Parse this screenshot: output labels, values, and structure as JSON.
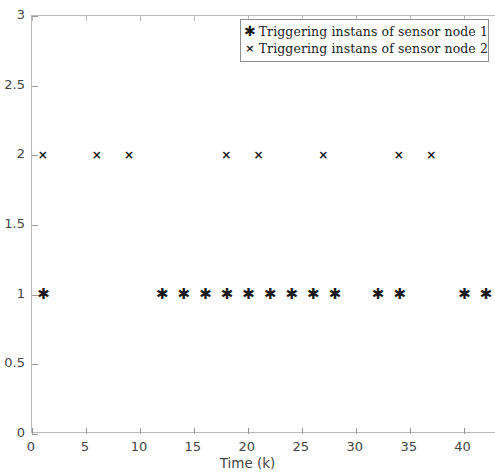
{
  "chart_data": {
    "type": "scatter",
    "title": "",
    "xlabel": "Time (k)",
    "ylabel": "",
    "xlim": [
      0,
      43
    ],
    "ylim": [
      0,
      3
    ],
    "xticks": [
      0,
      5,
      10,
      15,
      20,
      25,
      30,
      35,
      40
    ],
    "xtick_labels": [
      "0",
      "5",
      "10",
      "15",
      "20",
      "25",
      "30",
      "35",
      "40"
    ],
    "yticks": [
      0,
      0.5,
      1,
      1.5,
      2,
      2.5,
      3
    ],
    "ytick_labels": [
      "0",
      "0.5",
      "1",
      "1.5",
      "2",
      "2.5",
      "3"
    ],
    "grid": false,
    "legend_position": "upper right",
    "marker_color": "#1a1a1a",
    "axis_color": "#b9b9b9",
    "background_color": "#ffffff",
    "series": [
      {
        "name": "Triggering instans of sensor node 1",
        "marker": "*",
        "marker_name": "asterisk-marker",
        "y_level": 1,
        "x": [
          1,
          12,
          14,
          16,
          18,
          20,
          22,
          24,
          26,
          28,
          32,
          34,
          40,
          42
        ],
        "values": [
          1,
          1,
          1,
          1,
          1,
          1,
          1,
          1,
          1,
          1,
          1,
          1,
          1,
          1
        ]
      },
      {
        "name": "Triggering instans of sensor node 2",
        "marker": "x",
        "marker_name": "cross-marker",
        "y_level": 2,
        "x": [
          1,
          6,
          9,
          18,
          21,
          27,
          34,
          37
        ],
        "values": [
          2,
          2,
          2,
          2,
          2,
          2,
          2,
          2
        ]
      }
    ]
  },
  "legend": {
    "entries": [
      {
        "marker_glyph": "✱",
        "label": "Triggering instans of sensor node 1"
      },
      {
        "marker_glyph": "×",
        "label": "Triggering instans of sensor node 2"
      }
    ]
  },
  "axes": {
    "x_title": "Time (k)"
  }
}
